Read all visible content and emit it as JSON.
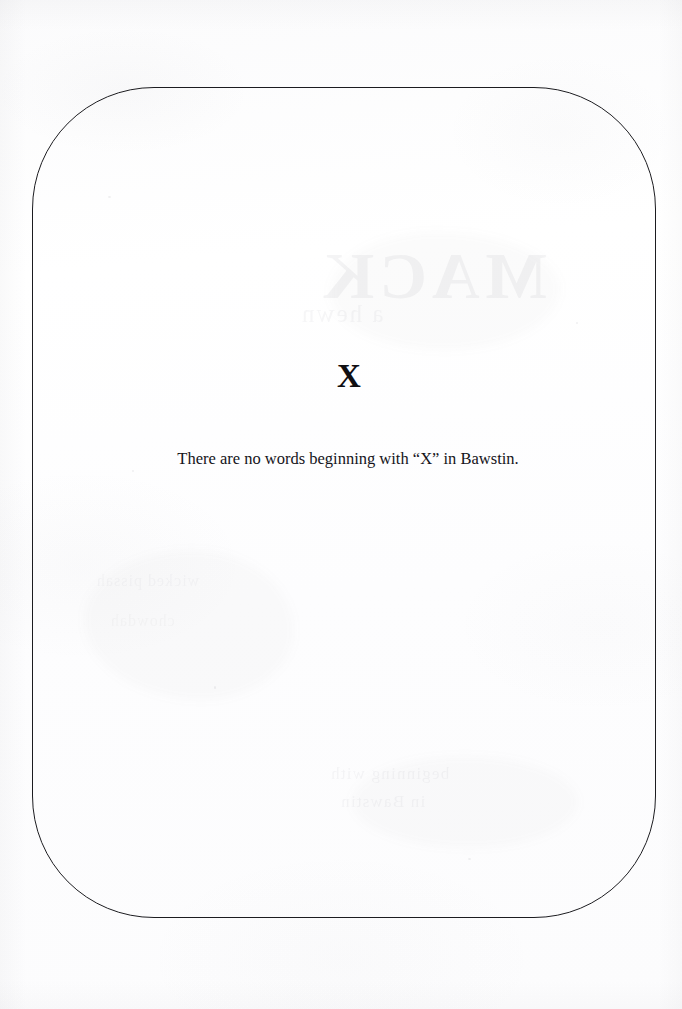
{
  "page": {
    "background_color": "#fdfdfd",
    "ink_color": "#15141a",
    "frame_border_color": "#1c1c20"
  },
  "frame": {
    "name": "rounded-rule-border",
    "left": 32,
    "top": 87,
    "width": 624,
    "height": 831,
    "corner_radius": 122
  },
  "content": {
    "letter_heading": "X",
    "entry_note": "There are no words beginning with “X” in Bawstin."
  },
  "bleed_through": {
    "title_ghost": "MACK",
    "subtitle_ghost": "a hewn",
    "line_a_ghost": "beginning with",
    "line_b_ghost": "in Bawstin",
    "line_c_ghost": "wicked pissah",
    "line_d_ghost": "chowdah"
  }
}
